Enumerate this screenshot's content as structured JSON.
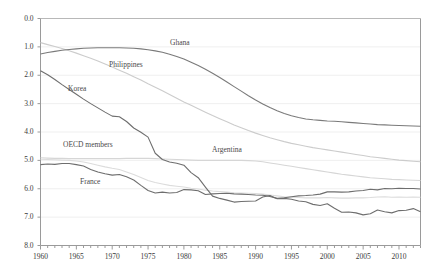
{
  "chart_data": {
    "type": "line",
    "title": "",
    "xlabel": "",
    "ylabel": "",
    "xlim": [
      1960,
      2013
    ],
    "ylim": [
      0.0,
      8.0
    ],
    "grid": true,
    "legend_position": "inline-annotations",
    "yticks": [
      "0.0",
      "1.0",
      "2.0",
      "3.0",
      "4.0",
      "5.0",
      "6.0",
      "7.0",
      "8.0"
    ],
    "xticks": [
      "1960",
      "1965",
      "1970",
      "1975",
      "1980",
      "1985",
      "1990",
      "1995",
      "2000",
      "2005",
      "2010"
    ],
    "x": [
      1960,
      1961,
      1962,
      1963,
      1964,
      1965,
      1966,
      1967,
      1968,
      1969,
      1970,
      1971,
      1972,
      1973,
      1974,
      1975,
      1976,
      1977,
      1978,
      1979,
      1980,
      1981,
      1982,
      1983,
      1984,
      1985,
      1986,
      1987,
      1988,
      1989,
      1990,
      1991,
      1992,
      1993,
      1994,
      1995,
      1996,
      1997,
      1998,
      1999,
      2000,
      2001,
      2002,
      2003,
      2004,
      2005,
      2006,
      2007,
      2008,
      2009,
      2010,
      2011,
      2012,
      2013
    ],
    "series": [
      {
        "name": "Ghana",
        "color": "#7a7a7a",
        "label_x": 170,
        "label_y": 38,
        "values": [
          6.75,
          6.8,
          6.84,
          6.88,
          6.91,
          6.93,
          6.95,
          6.96,
          6.97,
          6.97,
          6.97,
          6.97,
          6.96,
          6.95,
          6.93,
          6.9,
          6.86,
          6.81,
          6.74,
          6.66,
          6.57,
          6.46,
          6.34,
          6.21,
          6.07,
          5.92,
          5.76,
          5.6,
          5.44,
          5.28,
          5.13,
          4.99,
          4.86,
          4.75,
          4.65,
          4.57,
          4.51,
          4.46,
          4.43,
          4.41,
          4.39,
          4.38,
          4.36,
          4.34,
          4.32,
          4.3,
          4.28,
          4.26,
          4.25,
          4.24,
          4.23,
          4.22,
          4.21,
          4.2
        ]
      },
      {
        "name": "Philippines",
        "color": "#cccccc",
        "label_x": 109,
        "label_y": 60,
        "values": [
          7.15,
          7.08,
          7.01,
          6.94,
          6.86,
          6.78,
          6.69,
          6.6,
          6.5,
          6.4,
          6.29,
          6.18,
          6.07,
          5.95,
          5.83,
          5.7,
          5.58,
          5.45,
          5.32,
          5.19,
          5.06,
          4.94,
          4.82,
          4.7,
          4.58,
          4.47,
          4.36,
          4.25,
          4.15,
          4.05,
          3.96,
          3.88,
          3.8,
          3.73,
          3.66,
          3.6,
          3.55,
          3.5,
          3.45,
          3.41,
          3.37,
          3.33,
          3.29,
          3.25,
          3.21,
          3.17,
          3.13,
          3.1,
          3.07,
          3.04,
          3.01,
          2.99,
          2.97,
          2.95
        ]
      },
      {
        "name": "Argentina",
        "color": "#d6d6d6",
        "label_x": 212,
        "label_y": 145,
        "values": [
          3.09,
          3.08,
          3.07,
          3.07,
          3.06,
          3.06,
          3.06,
          3.06,
          3.06,
          3.06,
          3.06,
          3.06,
          3.07,
          3.07,
          3.07,
          3.07,
          3.06,
          3.05,
          3.04,
          3.03,
          3.02,
          3.01,
          3.0,
          3.0,
          3.0,
          3.0,
          3.0,
          3.0,
          3.0,
          2.99,
          2.98,
          2.95,
          2.91,
          2.87,
          2.83,
          2.79,
          2.75,
          2.71,
          2.67,
          2.63,
          2.59,
          2.55,
          2.51,
          2.48,
          2.45,
          2.42,
          2.39,
          2.37,
          2.35,
          2.33,
          2.32,
          2.31,
          2.3,
          2.29
        ]
      },
      {
        "name": "Korea",
        "color": "#6e6e6e",
        "label_x": 68,
        "label_y": 84,
        "values": [
          6.16,
          6.02,
          5.85,
          5.67,
          5.5,
          5.33,
          5.16,
          5.0,
          4.85,
          4.7,
          4.56,
          4.54,
          4.37,
          4.14,
          3.99,
          3.82,
          3.25,
          3.03,
          2.94,
          2.9,
          2.83,
          2.57,
          2.39,
          2.06,
          1.74,
          1.66,
          1.6,
          1.53,
          1.55,
          1.56,
          1.57,
          1.71,
          1.76,
          1.65,
          1.66,
          1.63,
          1.57,
          1.54,
          1.45,
          1.41,
          1.47,
          1.31,
          1.17,
          1.18,
          1.15,
          1.08,
          1.12,
          1.25,
          1.19,
          1.15,
          1.23,
          1.24,
          1.3,
          1.19
        ]
      },
      {
        "name": "OECD members",
        "color": "#dcdcdc",
        "label_x": 63,
        "label_y": 140,
        "values": [
          3.04,
          3.03,
          3.02,
          3.01,
          3.0,
          2.98,
          2.94,
          2.89,
          2.83,
          2.77,
          2.72,
          2.68,
          2.59,
          2.5,
          2.4,
          2.29,
          2.22,
          2.17,
          2.12,
          2.09,
          2.06,
          2.02,
          1.99,
          1.95,
          1.92,
          1.9,
          1.88,
          1.86,
          1.85,
          1.84,
          1.83,
          1.81,
          1.78,
          1.75,
          1.72,
          1.7,
          1.69,
          1.68,
          1.68,
          1.68,
          1.69,
          1.68,
          1.67,
          1.67,
          1.68,
          1.68,
          1.69,
          1.71,
          1.72,
          1.7,
          1.71,
          1.7,
          1.71,
          1.7
        ]
      },
      {
        "name": "France",
        "color": "#6e6e6e",
        "label_x": 80,
        "label_y": 177,
        "values": [
          2.85,
          2.87,
          2.86,
          2.89,
          2.89,
          2.85,
          2.8,
          2.68,
          2.59,
          2.53,
          2.48,
          2.5,
          2.42,
          2.31,
          2.12,
          1.94,
          1.85,
          1.88,
          1.85,
          1.87,
          1.97,
          1.96,
          1.93,
          1.8,
          1.82,
          1.83,
          1.84,
          1.82,
          1.81,
          1.8,
          1.78,
          1.77,
          1.73,
          1.66,
          1.68,
          1.72,
          1.75,
          1.76,
          1.78,
          1.81,
          1.89,
          1.89,
          1.88,
          1.89,
          1.92,
          1.94,
          1.98,
          1.96,
          2.01,
          2.0,
          2.02,
          2.01,
          2.01,
          1.99
        ]
      }
    ]
  },
  "axis": {
    "y_values": [
      8.0,
      7.0,
      6.0,
      5.0,
      4.0,
      3.0,
      2.0,
      1.0,
      0.0
    ],
    "x_values": [
      1960,
      1965,
      1970,
      1975,
      1980,
      1985,
      1990,
      1995,
      2000,
      2005,
      2010
    ]
  }
}
